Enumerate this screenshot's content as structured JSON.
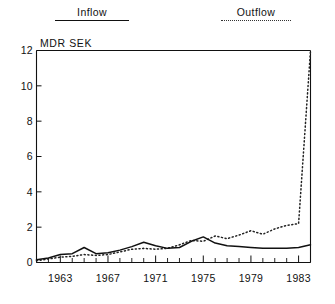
{
  "legend": {
    "inflow": {
      "label": "Inflow",
      "style": "solid",
      "color": "#111111"
    },
    "outflow": {
      "label": "Outflow",
      "style": "dotted",
      "color": "#222222"
    }
  },
  "axes": {
    "unit_label": "MDR SEK",
    "y_ticks": [
      "0",
      "2",
      "4",
      "6",
      "8",
      "10",
      "12"
    ],
    "x_ticks": [
      "1963",
      "1967",
      "1971",
      "1975",
      "1979",
      "1983"
    ]
  },
  "chart_data": {
    "type": "line",
    "title": "",
    "subtitle": "",
    "xlabel": "",
    "ylabel": "MDR SEK",
    "ylim": [
      0,
      12
    ],
    "xlim": [
      1961,
      1984
    ],
    "grid": false,
    "legend_position": "top",
    "y_ticks": [
      0,
      2,
      4,
      6,
      8,
      10,
      12
    ],
    "x_tick_values": [
      1963,
      1967,
      1971,
      1975,
      1979,
      1983
    ],
    "x_minor_tick_interval": 1,
    "x": [
      1961,
      1962,
      1963,
      1964,
      1965,
      1966,
      1967,
      1968,
      1969,
      1970,
      1971,
      1972,
      1973,
      1974,
      1975,
      1976,
      1977,
      1978,
      1979,
      1980,
      1981,
      1982,
      1983,
      1984
    ],
    "series": [
      {
        "name": "Inflow",
        "style": "solid",
        "color": "#111111",
        "values": [
          0.15,
          0.25,
          0.45,
          0.5,
          0.85,
          0.5,
          0.55,
          0.7,
          0.9,
          1.15,
          0.95,
          0.8,
          0.85,
          1.2,
          1.45,
          1.1,
          0.95,
          0.9,
          0.85,
          0.8,
          0.8,
          0.8,
          0.85,
          1.0
        ]
      },
      {
        "name": "Outflow",
        "style": "dotted",
        "color": "#222222",
        "values": [
          0.1,
          0.2,
          0.3,
          0.35,
          0.45,
          0.4,
          0.45,
          0.6,
          0.75,
          0.8,
          0.75,
          0.8,
          1.0,
          1.25,
          1.2,
          1.5,
          1.35,
          1.55,
          1.8,
          1.6,
          1.9,
          2.1,
          2.2,
          12.0
        ]
      }
    ]
  }
}
